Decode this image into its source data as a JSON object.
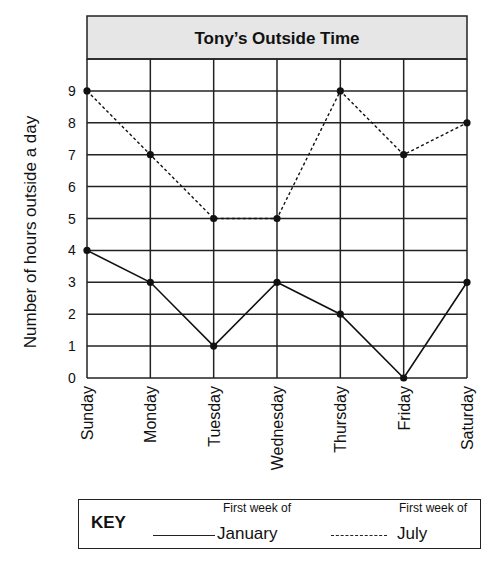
{
  "chart_data": {
    "type": "line",
    "title": "Tony’s Outside Time",
    "xlabel": "",
    "ylabel": "Number of hours outside a day",
    "categories": [
      "Sunday",
      "Monday",
      "Tuesday",
      "Wednesday",
      "Thursday",
      "Friday",
      "Saturday"
    ],
    "y_ticks": [
      "0",
      "1",
      "2",
      "3",
      "4",
      "5",
      "6",
      "7",
      "8",
      "9"
    ],
    "ylim": [
      0,
      10
    ],
    "grid": true,
    "legend_position": "bottom",
    "series": [
      {
        "name": "First week of January",
        "style": "solid",
        "values": [
          4,
          3,
          1,
          3,
          2,
          0,
          3
        ]
      },
      {
        "name": "First week of July",
        "style": "dashed",
        "values": [
          9,
          7,
          5,
          5,
          9,
          7,
          8
        ]
      }
    ]
  },
  "key": {
    "title": "KEY",
    "january_sub": "First week of",
    "january_label": "January",
    "july_sub": "First week of",
    "july_label": "July"
  },
  "colors": {
    "title_bg": "#e6e6e6",
    "grid": "#222222",
    "line": "#111111"
  }
}
